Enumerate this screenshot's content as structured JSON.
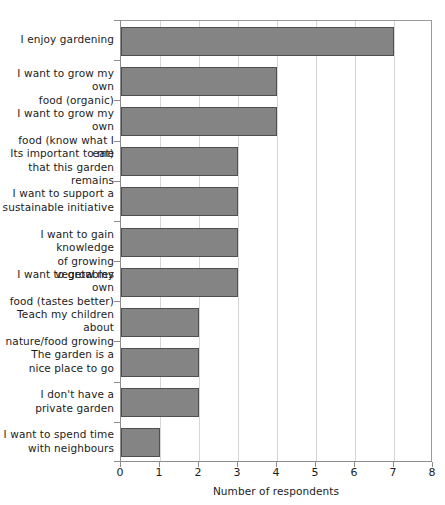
{
  "chart_data": {
    "type": "bar",
    "orientation": "horizontal",
    "title": "",
    "xlabel": "Number of respondents",
    "ylabel": "",
    "xlim": [
      0,
      8
    ],
    "xticks": [
      0,
      1,
      2,
      3,
      4,
      5,
      6,
      7,
      8
    ],
    "grid": "vertical",
    "legend": "none",
    "bar_color": "#848484",
    "bar_edge_color": "#4f4f4f",
    "gridline_color": "#d6d6d6",
    "axis_color": "#8c8c8c",
    "categories": [
      "I enjoy gardening",
      "I want to grow my own food (organic)",
      "I want to grow my own food (know what I eat)",
      "Its important to me that this garden remains",
      "I want to support a sustainable initiative",
      "I want to gain knowledge of growing vegetables",
      "I want to grow my own food (tastes better)",
      "Teach my children about nature/food growing",
      "The garden is a nice place to go",
      "I don't have a private garden",
      "I want to spend time with neighbours"
    ],
    "category_lines": [
      [
        "I enjoy gardening"
      ],
      [
        "I want to grow my own",
        "food (organic)"
      ],
      [
        "I want to grow my own",
        "food (know what I eat)"
      ],
      [
        "Its important to me",
        "that this garden remains"
      ],
      [
        "I want to support a",
        "sustainable initiative"
      ],
      [
        "I want to gain knowledge",
        "of growing vegetables"
      ],
      [
        "I want to grow my own",
        "food (tastes better)"
      ],
      [
        "Teach my children about",
        "nature/food growing"
      ],
      [
        "The garden is a",
        "nice place to go"
      ],
      [
        "I don't have a",
        "private garden"
      ],
      [
        "I want to spend time",
        "with neighbours"
      ]
    ],
    "values": [
      7,
      4,
      4,
      3,
      3,
      3,
      3,
      2,
      2,
      2,
      1
    ]
  }
}
